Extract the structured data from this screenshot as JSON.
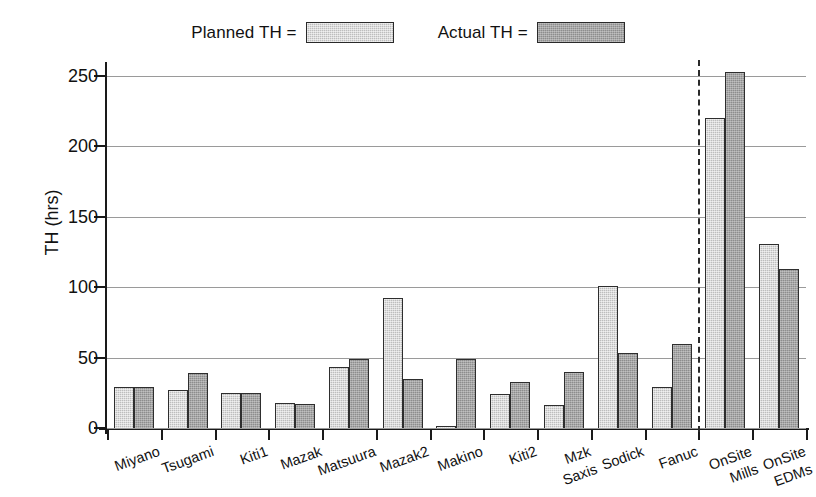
{
  "chart_data": {
    "type": "bar",
    "title": "",
    "xlabel": "",
    "ylabel": "TH (hrs)",
    "ylim": [
      0,
      262
    ],
    "yticks": [
      0,
      50,
      100,
      150,
      200,
      250
    ],
    "grid": true,
    "legend_position": "top-center",
    "categories": [
      "Miyano",
      "Tsugami",
      "Kiti1",
      "Mazak",
      "Matsuura",
      "Mazak2",
      "Makino",
      "Kiti2",
      "Mzk\nSaxis",
      "Sodick",
      "Fanuc",
      "OnSite\nMills",
      "OnSite\nEDMs"
    ],
    "series": [
      {
        "name": "Planned TH =",
        "color": "#bdbdbd",
        "values": [
          29,
          27,
          25,
          18,
          43,
          92,
          1.5,
          24,
          16,
          101,
          29,
          220,
          131
        ]
      },
      {
        "name": "Actual TH =",
        "color": "#8d8d8d",
        "values": [
          29,
          39,
          25,
          17,
          49,
          35,
          49,
          33,
          40,
          53,
          60,
          253,
          113
        ]
      }
    ],
    "annotations": [
      {
        "type": "vertical-dashed-divider",
        "position_after_category": "Fanuc",
        "color": "#2a2a2a"
      }
    ]
  },
  "legend": {
    "entries": [
      {
        "label": "Planned TH =",
        "swatch": "planned"
      },
      {
        "label": "Actual TH =",
        "swatch": "actual"
      }
    ]
  }
}
